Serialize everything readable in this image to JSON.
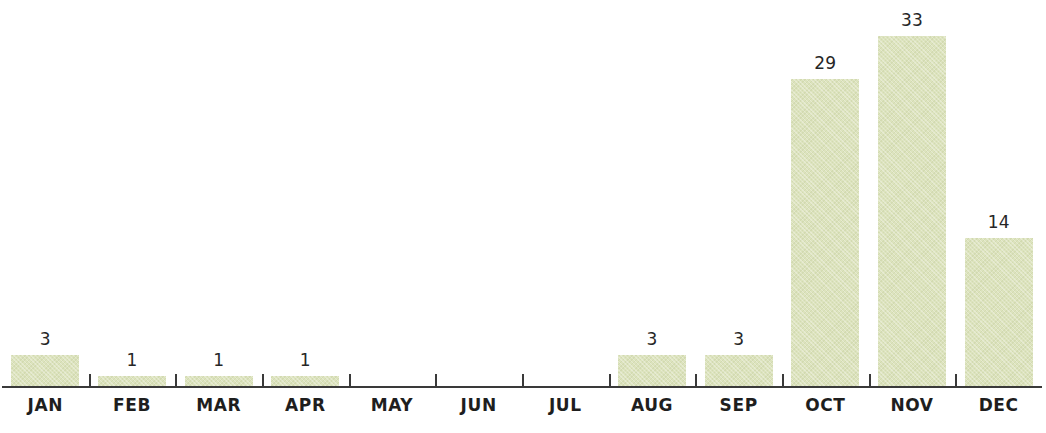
{
  "chart_data": {
    "type": "bar",
    "title": "",
    "subtitle": "",
    "xlabel": "",
    "ylabel": "",
    "categories": [
      "JAN",
      "FEB",
      "MAR",
      "APR",
      "MAY",
      "JUN",
      "JUL",
      "AUG",
      "SEP",
      "OCT",
      "NOV",
      "DEC"
    ],
    "values": [
      3,
      1,
      1,
      1,
      0,
      0,
      0,
      3,
      3,
      29,
      33,
      14
    ],
    "value_labels": [
      "3",
      "1",
      "1",
      "1",
      "",
      "",
      "",
      "3",
      "3",
      "29",
      "33",
      "14"
    ],
    "ylim": [
      0,
      33
    ],
    "grid": false,
    "legend": null,
    "bar_color": "#dce3bd",
    "axis_color": "#3a3a3a",
    "label_color": "#1e1e1e",
    "background_color": "#ffffff"
  }
}
